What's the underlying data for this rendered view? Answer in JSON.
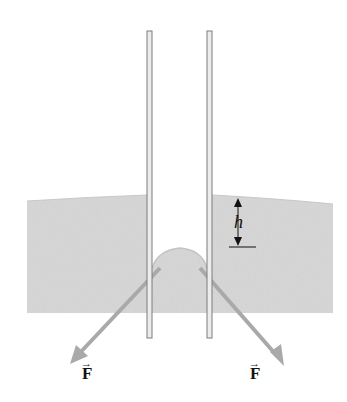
{
  "diagram": {
    "labels": {
      "height": "h",
      "force_left": "F",
      "force_right": "F",
      "vector_arrow": "→"
    },
    "colors": {
      "liquid": "#d4d4d4",
      "liquid_edge": "#bdbdbd",
      "tube_wall": "#8a8a8a",
      "tube_fill": "#e8e8e8",
      "force_arrow": "#a9a9a9",
      "annotation": "#111111"
    }
  }
}
